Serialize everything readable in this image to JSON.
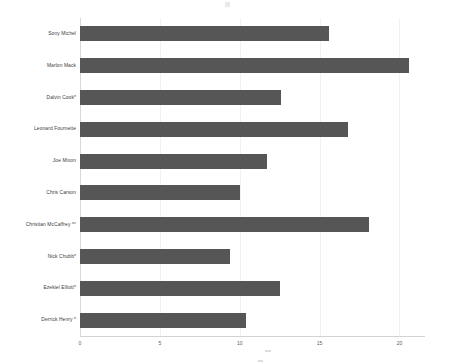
{
  "chart_data": {
    "type": "bar",
    "orientation": "horizontal",
    "title": "",
    "subtitle": "",
    "xlabel": "",
    "ylabel": "",
    "categories": [
      "Sony Michel",
      "Marlon Mack",
      "Dalvin Cook*",
      "Leonard Fournette",
      "Joe Mixon",
      "Chris Carson",
      "Christian McCaffrey *°",
      "Nick Chubb*",
      "Ezekiel Elliott*",
      "Derrick Henry *"
    ],
    "values": [
      15.6,
      20.6,
      12.6,
      16.8,
      11.7,
      10.0,
      18.1,
      9.4,
      12.5,
      10.4
    ],
    "xlim": [
      0,
      21.6
    ],
    "xticks": [
      0,
      5,
      10,
      15,
      20
    ],
    "xticklabels": [
      "0",
      "5",
      "10",
      "15",
      "20"
    ],
    "grid": true,
    "grid_axis": "x",
    "legend": null,
    "bar_color": "#565656",
    "gridline_color": "#f1f1f1",
    "axis_color": "#d2d2d2"
  },
  "axis": {
    "x_title": ""
  },
  "colors": {
    "bar": "#565656",
    "background": "#ffffff",
    "label_text": "#3a3a3a",
    "tick_text": "#5a5a5a"
  }
}
